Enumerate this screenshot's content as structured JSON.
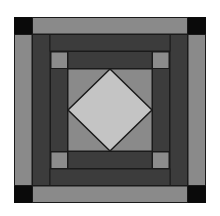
{
  "figure": {
    "colors": {
      "background": "#ffffff",
      "outer_band": "#8a8a8a",
      "corner_block": "#0a0a0a",
      "dark_band": "#3c3c3c",
      "accent_square": "#8c8c8c",
      "center_square": "#8a8a8a",
      "diamond": "#c4c4c4",
      "seam": "#1a1a1a"
    }
  }
}
